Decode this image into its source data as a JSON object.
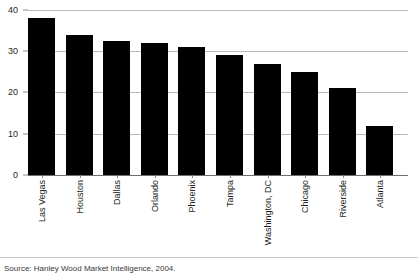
{
  "chart_data": {
    "type": "bar",
    "title": "",
    "xlabel": "",
    "ylabel": "",
    "ylim": [
      0,
      40
    ],
    "yticks": [
      0,
      10,
      20,
      30,
      40
    ],
    "grid": true,
    "legend": false,
    "bar_color": "#010101",
    "categories": [
      "Las Vegas",
      "Houston",
      "Dallas",
      "Orlando",
      "Phoenix",
      "Tampa",
      "Washington, DC",
      "Chicago",
      "Riverside",
      "Atlanta"
    ],
    "values": [
      38,
      34,
      32.5,
      32,
      31,
      29,
      27,
      25,
      21,
      12
    ]
  },
  "axis": {
    "y_tick_labels": [
      "40",
      "30",
      "20",
      "10",
      "0"
    ]
  },
  "footer": {
    "source": "Source: Hanley Wood Market Intelligence, 2004."
  }
}
